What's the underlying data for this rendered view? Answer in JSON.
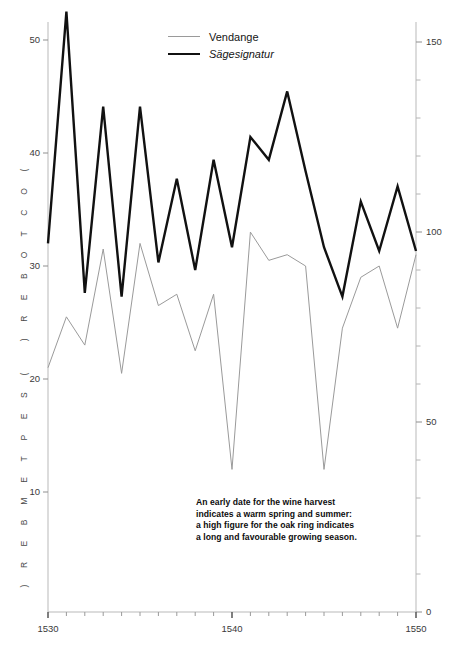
{
  "header_faint": "",
  "legend": {
    "items": [
      {
        "label": "Vendange",
        "color": "#9a9a9a",
        "style": "thin",
        "italic": false
      },
      {
        "label": "Sägesignatur",
        "color": "#111111",
        "style": "thick",
        "italic": true
      }
    ]
  },
  "annotation": {
    "lines": [
      "An early date for the wine harvest",
      "indicates a warm spring and summer:",
      "a high figure for the oak ring indicates",
      "a long and favourable growing season."
    ]
  },
  "axes": {
    "left_upper_label": "( O C T O B E R )",
    "left_lower_label": "( S E P T E M B E R )",
    "left_ticks": [
      "50",
      "40",
      "30",
      "20",
      "10"
    ],
    "right_ticks": [
      "150",
      "100",
      "50",
      "0"
    ],
    "x_ticks": [
      "1530",
      "1540",
      "1550"
    ]
  },
  "chart_data": {
    "type": "line",
    "title": "",
    "subtitle": "",
    "xlabel": "",
    "ylabel": "( O C T O B E R )  /  ( S E P T E M B E R )",
    "y2label": "",
    "xlim": [
      1530,
      1550
    ],
    "ylim": [
      5,
      54
    ],
    "y2lim": [
      0,
      160
    ],
    "grid": false,
    "legend_position": "top-center",
    "x": [
      1530,
      1531,
      1532,
      1533,
      1534,
      1535,
      1536,
      1537,
      1538,
      1539,
      1540,
      1541,
      1542,
      1543,
      1544,
      1545,
      1546,
      1547,
      1548,
      1549,
      1550
    ],
    "series": [
      {
        "name": "Vendange",
        "axis": "left",
        "color": "#9a9a9a",
        "width": 1.0,
        "units": "day of September/October",
        "values": [
          21.0,
          25.5,
          23.0,
          31.5,
          20.5,
          32.0,
          26.5,
          27.5,
          22.5,
          27.5,
          12.0,
          33.0,
          30.5,
          31.0,
          30.0,
          12.0,
          24.5,
          29.0,
          30.0,
          24.5,
          31.0
        ]
      },
      {
        "name": "Sägesignatur",
        "axis": "right",
        "color": "#111111",
        "width": 2.4,
        "units": "oak ring index",
        "values": [
          97,
          158,
          84,
          133,
          83,
          133,
          92,
          114,
          90,
          119,
          96,
          125,
          119,
          137,
          116,
          96,
          83,
          108,
          95,
          112,
          95
        ]
      }
    ],
    "annotations": [
      "An early date for the wine harvest",
      "indicates a warm spring and summer:",
      "a high figure for the oak ring indicates",
      "a long and favourable growing season."
    ]
  }
}
